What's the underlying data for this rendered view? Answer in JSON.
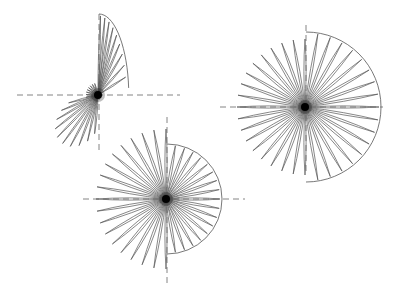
{
  "diagram": {
    "width": 393,
    "height": 296,
    "background": "#ffffff",
    "stroke_color": "#555555",
    "axis_color": "#666666",
    "figures": [
      {
        "name": "fan-small",
        "center": [
          98,
          95
        ],
        "h_axis": [
          17,
          180
        ],
        "v_axis": [
          14,
          152
        ],
        "arc_radius": 81,
        "arc_start_deg": -90,
        "arc_end_deg": -10,
        "arc_squash": 0.35,
        "petals_outside": 9,
        "petals_lower": 10,
        "petal_len_lower": 60,
        "lower_start_deg": 95,
        "lower_end_deg": 165
      },
      {
        "name": "fan-large",
        "center": [
          305,
          107
        ],
        "h_axis": [
          220,
          383
        ],
        "v_axis": [
          25,
          175
        ],
        "arc_radius": 75,
        "petals_total": 36,
        "petal_len_free": 68
      },
      {
        "name": "fan-medium",
        "center": [
          166,
          199
        ],
        "h_axis": [
          83,
          245
        ],
        "v_axis": [
          117,
          285
        ],
        "arc_radius": 55,
        "petals_total": 36,
        "petal_len_free": 70
      }
    ]
  }
}
